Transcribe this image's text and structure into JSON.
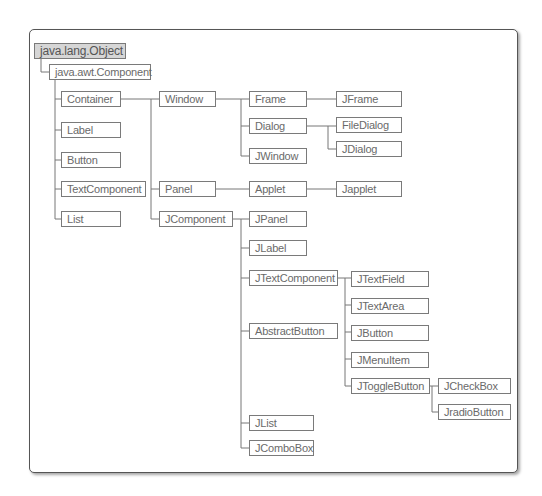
{
  "diagram": {
    "nodes": [
      {
        "id": "object",
        "label": "java.lang.Object"
      },
      {
        "id": "component",
        "label": "java.awt.Component"
      },
      {
        "id": "container",
        "label": "Container"
      },
      {
        "id": "label",
        "label": "Label"
      },
      {
        "id": "button",
        "label": "Button"
      },
      {
        "id": "textcomponent",
        "label": "TextComponent"
      },
      {
        "id": "list",
        "label": "List"
      },
      {
        "id": "window",
        "label": "Window"
      },
      {
        "id": "panel",
        "label": "Panel"
      },
      {
        "id": "jcomponent",
        "label": "JComponent"
      },
      {
        "id": "frame",
        "label": "Frame"
      },
      {
        "id": "dialog",
        "label": "Dialog"
      },
      {
        "id": "jwindow",
        "label": "JWindow"
      },
      {
        "id": "applet",
        "label": "Applet"
      },
      {
        "id": "jpanel",
        "label": "JPanel"
      },
      {
        "id": "jlabel",
        "label": "JLabel"
      },
      {
        "id": "jtextcomponent",
        "label": "JTextComponent"
      },
      {
        "id": "abstractbutton",
        "label": "AbstractButton"
      },
      {
        "id": "jlist",
        "label": "JList"
      },
      {
        "id": "jcombobox",
        "label": "JComboBox"
      },
      {
        "id": "jframe",
        "label": "JFrame"
      },
      {
        "id": "filedialog",
        "label": "FileDialog"
      },
      {
        "id": "jdialog",
        "label": "JDialog"
      },
      {
        "id": "japplet",
        "label": "Japplet"
      },
      {
        "id": "jtextfield",
        "label": "JTextField"
      },
      {
        "id": "jtextarea",
        "label": "JTextArea"
      },
      {
        "id": "jbutton",
        "label": "JButton"
      },
      {
        "id": "jmenuitem",
        "label": "JMenuItem"
      },
      {
        "id": "jtogglebutton",
        "label": "JToggleButton"
      },
      {
        "id": "jcheckbox",
        "label": "JCheckBox"
      },
      {
        "id": "jradiobutton",
        "label": "JradioButton"
      }
    ],
    "edges": [
      [
        "object",
        "component"
      ],
      [
        "component",
        "container"
      ],
      [
        "component",
        "label"
      ],
      [
        "component",
        "button"
      ],
      [
        "component",
        "textcomponent"
      ],
      [
        "component",
        "list"
      ],
      [
        "container",
        "window"
      ],
      [
        "container",
        "panel"
      ],
      [
        "container",
        "jcomponent"
      ],
      [
        "window",
        "frame"
      ],
      [
        "window",
        "dialog"
      ],
      [
        "window",
        "jwindow"
      ],
      [
        "frame",
        "jframe"
      ],
      [
        "dialog",
        "filedialog"
      ],
      [
        "dialog",
        "jdialog"
      ],
      [
        "panel",
        "applet"
      ],
      [
        "applet",
        "japplet"
      ],
      [
        "jcomponent",
        "jpanel"
      ],
      [
        "jcomponent",
        "jlabel"
      ],
      [
        "jcomponent",
        "jtextcomponent"
      ],
      [
        "jcomponent",
        "abstractbutton"
      ],
      [
        "jcomponent",
        "jlist"
      ],
      [
        "jcomponent",
        "jcombobox"
      ],
      [
        "jtextcomponent",
        "jtextfield"
      ],
      [
        "jtextcomponent",
        "jtextarea"
      ],
      [
        "abstractbutton",
        "jbutton"
      ],
      [
        "abstractbutton",
        "jmenuitem"
      ],
      [
        "abstractbutton",
        "jtogglebutton"
      ],
      [
        "jtogglebutton",
        "jcheckbox"
      ],
      [
        "jtogglebutton",
        "jradiobutton"
      ]
    ]
  }
}
